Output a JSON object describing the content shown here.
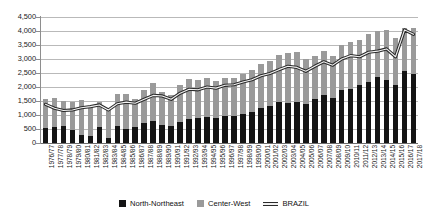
{
  "chart_data": {
    "type": "bar",
    "title": "",
    "subtitle": "",
    "xlabel": "",
    "ylabel": "",
    "ylim": [
      0,
      4500
    ],
    "ytick_step": 500,
    "ytick_labels": [
      "4,500",
      "4,000",
      "3,500",
      "3,000",
      "2,500",
      "2,000",
      "1,500",
      "1,000",
      "500",
      "0"
    ],
    "grid": true,
    "stacked": true,
    "legend_position": "bottom",
    "categories": [
      "1976/77",
      "1977/78",
      "1978/79",
      "1979/80",
      "1980/81",
      "1981/82",
      "1982/83",
      "1983/84",
      "1984/85",
      "1985/86",
      "1986/87",
      "1987/88",
      "1988/89",
      "1989/90",
      "1990/91",
      "1991/92",
      "1992/93",
      "1993/94",
      "1994/95",
      "1995/96",
      "1996/97",
      "1997/98",
      "1998/99",
      "1999/00",
      "2000/01",
      "2001/02",
      "2002/03",
      "2003/04",
      "2004/05",
      "2005/06",
      "2006/07",
      "2007/08",
      "2008/09",
      "2009/10",
      "2010/11",
      "2011/12",
      "2012/13",
      "2013/14",
      "2014/15",
      "2015/16",
      "2016/17",
      "2017/18"
    ],
    "series": [
      {
        "name": "North-Northeast",
        "color": "#141414",
        "type": "bar",
        "values": [
          520,
          560,
          590,
          480,
          300,
          260,
          560,
          180,
          620,
          500,
          560,
          700,
          780,
          640,
          600,
          760,
          860,
          900,
          920,
          900,
          980,
          960,
          1040,
          1120,
          1260,
          1320,
          1480,
          1420,
          1480,
          1400,
          1560,
          1700,
          1620,
          1880,
          1940,
          2060,
          2180,
          2340,
          2260,
          2060,
          2560,
          2480
        ]
      },
      {
        "name": "Center-West",
        "color": "#9a9a9a",
        "type": "bar",
        "values": [
          1060,
          1040,
          900,
          1000,
          1220,
          1080,
          900,
          1060,
          1120,
          1260,
          1000,
          1200,
          1360,
          1180,
          1120,
          1320,
          1420,
          1340,
          1420,
          1300,
          1340,
          1380,
          1420,
          1480,
          1560,
          1600,
          1680,
          1800,
          1760,
          1600,
          1560,
          1600,
          1480,
          1620,
          1680,
          1620,
          1700,
          1660,
          1780,
          1680,
          1540,
          1620
        ]
      },
      {
        "name": "BRAZIL",
        "color": "#2b2b2b",
        "type": "line",
        "values": [
          1380,
          1240,
          1160,
          1180,
          1260,
          1300,
          1360,
          1180,
          1400,
          1460,
          1420,
          1560,
          1700,
          1680,
          1560,
          1780,
          1920,
          1900,
          2000,
          1960,
          2060,
          2080,
          2180,
          2260,
          2400,
          2480,
          2620,
          2740,
          2700,
          2560,
          2740,
          2900,
          2780,
          3000,
          3120,
          3080,
          3240,
          3280,
          3360,
          3080,
          4040,
          3880
        ]
      }
    ]
  },
  "legend": {
    "items": [
      {
        "label": "North-Northeast",
        "marker": "square-black"
      },
      {
        "label": "Center-West",
        "marker": "square-gray"
      },
      {
        "label": "BRAZIL",
        "marker": "line-outlined"
      }
    ]
  }
}
